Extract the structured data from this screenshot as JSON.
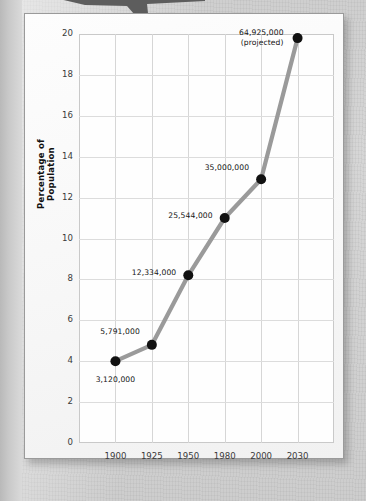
{
  "page": {
    "background_color": "#d6d6d6",
    "card_color": "#fbfbfb",
    "callout_color": "#5d5d5d"
  },
  "chart_data": {
    "type": "line",
    "title": "",
    "xlabel": "Year",
    "ylabel": "Percentage of Population",
    "categories": [
      "1900",
      "1925",
      "1950",
      "1980",
      "2000",
      "2030"
    ],
    "values": [
      4.0,
      4.8,
      8.2,
      11.0,
      12.9,
      19.8
    ],
    "point_labels": [
      "3,120,000",
      "5,791,000",
      "12,334,000",
      "25,544,000",
      "35,000,000",
      "64,925,000\n(projected)"
    ],
    "ylim": [
      0,
      20
    ],
    "yticks": [
      "0",
      "2",
      "4",
      "6",
      "8",
      "10",
      "12",
      "14",
      "16",
      "18",
      "20"
    ],
    "xticks": [
      "1900",
      "1925",
      "1950",
      "1980",
      "2000",
      "2030"
    ],
    "grid": true,
    "legend": "none",
    "series_color": "#9a9a9a",
    "marker_color": "#111111"
  }
}
